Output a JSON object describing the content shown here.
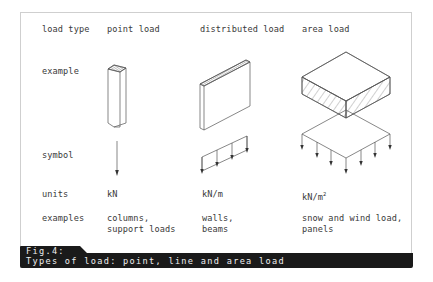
{
  "figure": {
    "label": "Fig.4:",
    "caption": "Types of load: point, line and area load"
  },
  "rows": {
    "load_type": "load type",
    "example": "example",
    "symbol": "symbol",
    "units": "units",
    "examples": "examples"
  },
  "columns": [
    {
      "load_type": "point load",
      "units": "kN",
      "units_sup": "",
      "examples_line1": "columns,",
      "examples_line2": "support loads",
      "example_icon": "column-icon",
      "symbol_icon": "point-load-arrow-icon"
    },
    {
      "load_type": "distributed load",
      "units": "kN/m",
      "units_sup": "",
      "examples_line1": "walls,",
      "examples_line2": "beams",
      "example_icon": "wall-icon",
      "symbol_icon": "line-load-arrows-icon"
    },
    {
      "load_type": "area load",
      "units": "kN/m",
      "units_sup": "2",
      "examples_line1": "snow and wind load,",
      "examples_line2": "panels",
      "example_icon": "slab-icon",
      "symbol_icon": "area-load-arrows-icon"
    }
  ],
  "colors": {
    "line": "#555555",
    "caption_bg": "#1a1a1a",
    "caption_text": "#f0f0f0",
    "frame": "#cfcfcf"
  }
}
